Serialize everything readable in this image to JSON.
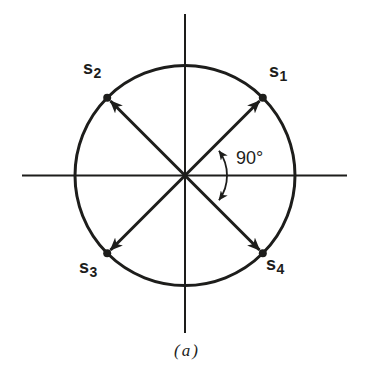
{
  "colors": {
    "ink": "#1d1d1b",
    "background": "#ffffff"
  },
  "diagram": {
    "caption": "(a)",
    "angle_label": "90°",
    "points": [
      {
        "id": "s1",
        "base": "s",
        "sub": "1",
        "position": "top-right",
        "angle_deg": 45
      },
      {
        "id": "s2",
        "base": "s",
        "sub": "2",
        "position": "top-left",
        "angle_deg": 135
      },
      {
        "id": "s3",
        "base": "s",
        "sub": "3",
        "position": "bottom-left",
        "angle_deg": 225
      },
      {
        "id": "s4",
        "base": "s",
        "sub": "4",
        "position": "bottom-right",
        "angle_deg": 315
      }
    ]
  }
}
